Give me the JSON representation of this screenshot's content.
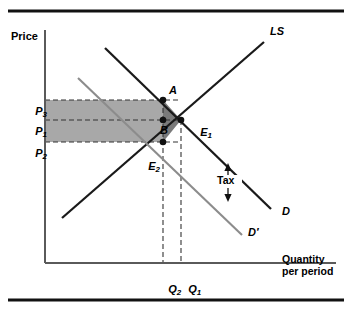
{
  "figure": {
    "type": "economics-supply-demand-tax-diagram",
    "axes": {
      "y_axis_label": "Price",
      "x_axis_label_line1": "Quantity",
      "x_axis_label_line2": "per period"
    },
    "price_ticks": [
      {
        "id": "P3",
        "base": "P",
        "sub": "3",
        "y": 100
      },
      {
        "id": "P1",
        "base": "P",
        "sub": "1",
        "y": 120
      },
      {
        "id": "P2",
        "base": "P",
        "sub": "2",
        "y": 142
      }
    ],
    "quantity_ticks": [
      {
        "id": "Q2",
        "base": "Q",
        "sub": "2",
        "x": 163
      },
      {
        "id": "Q1",
        "base": "Q",
        "sub": "1",
        "x": 181
      }
    ],
    "curves": [
      {
        "name": "LS",
        "label": "LS",
        "role": "long-run-supply",
        "color": "#1a1a1a"
      },
      {
        "name": "D",
        "label": "D",
        "role": "demand-before-tax",
        "color": "#1a1a1a"
      },
      {
        "name": "Dprime",
        "label": "D′",
        "role": "demand-after-tax",
        "color": "#8c8c8c"
      }
    ],
    "points": [
      {
        "id": "A",
        "label": "A",
        "x": 163,
        "y": 100
      },
      {
        "id": "B",
        "label": "B",
        "x": 163,
        "y": 120
      },
      {
        "id": "E1",
        "base": "E",
        "sub": "1",
        "x": 181,
        "y": 120
      },
      {
        "id": "E2",
        "base": "E",
        "sub": "2",
        "x": 163,
        "y": 142
      }
    ],
    "annotations": [
      {
        "id": "tax-gap",
        "label": "Tax",
        "x": 228,
        "y": 183
      }
    ],
    "regions": [
      {
        "id": "tax-revenue-rectangle",
        "fill": "#a8a8a8",
        "x": 45,
        "y": 100,
        "width": 118,
        "height": 42
      },
      {
        "id": "deadweight-loss-triangle",
        "fill": "#7a7a7a",
        "vertices": "163,100 181,120 163,142"
      }
    ],
    "colors": {
      "shaded_rect": "#a8a8a8",
      "shaded_triangle": "#7a7a7a",
      "curve_dark": "#1a1a1a",
      "curve_light": "#8c8c8c",
      "axis": "#5a5a5a",
      "rule": "#111111",
      "background": "#ffffff"
    }
  }
}
